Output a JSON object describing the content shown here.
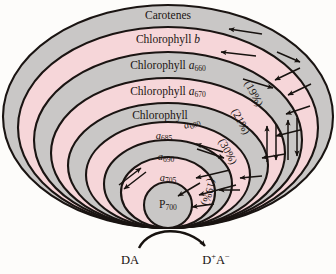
{
  "figure": {
    "background_color": "#fdfcfa",
    "outline_color": "#1a1412"
  },
  "colors": {
    "gray_band": "#c9c7c6",
    "pink_band": "#f6d6d9",
    "outline": "#1a1412",
    "text": "#17120f"
  },
  "bands": [
    {
      "index": 0,
      "label_main": "Carotenes",
      "label_sub": "",
      "italic_part": "",
      "fill": "#c9c7c6",
      "label_x": 168,
      "label_y": 16
    },
    {
      "index": 1,
      "label_main": "Chlorophyll ",
      "italic_part": "b",
      "label_sub": "",
      "fill": "#f6d6d9",
      "label_x": 168,
      "label_y": 40
    },
    {
      "index": 2,
      "label_main": "Chlorophyll ",
      "italic_part": "a",
      "label_sub": "660",
      "fill": "#c9c7c6",
      "label_x": 168,
      "label_y": 66
    },
    {
      "index": 3,
      "label_main": "Chlorophyll ",
      "italic_part": "a",
      "label_sub": "670",
      "fill": "#f6d6d9",
      "label_x": 168,
      "label_y": 92
    },
    {
      "index": 4,
      "label_main": "Chlorophyll",
      "italic_part": "",
      "label_sub": "",
      "fill": "#c9c7c6",
      "label_x": 160,
      "label_y": 116
    },
    {
      "index": 5,
      "label_main": "",
      "italic_part": "a",
      "label_sub": "685",
      "fill": "#f6d6d9",
      "label_x": 164,
      "label_y": 137
    },
    {
      "index": 6,
      "label_main": "",
      "italic_part": "a",
      "label_sub": "690",
      "fill": "#c9c7c6",
      "label_x": 166,
      "label_y": 158
    },
    {
      "index": 7,
      "label_main": "",
      "italic_part": "a",
      "label_sub": "705",
      "fill": "#f6d6d9",
      "label_x": 168,
      "label_y": 179
    },
    {
      "index": 8,
      "label_main": "P",
      "italic_part": "",
      "label_sub": "700",
      "fill": "#c9c7c6",
      "label_x": 168,
      "label_y": 205
    }
  ],
  "floating_labels": [
    {
      "name": "a680-label",
      "italic_part": "a",
      "label_sub": "680",
      "x": 192,
      "y": 124,
      "rotate": -22
    }
  ],
  "percentages": [
    {
      "name": "pct-19-upper",
      "text": "(19%)",
      "x": 253,
      "y": 94,
      "rotate": 62
    },
    {
      "name": "pct-21",
      "text": "(21%)",
      "x": 240,
      "y": 122,
      "rotate": 62
    },
    {
      "name": "pct-30",
      "text": "(30%)",
      "x": 227,
      "y": 152,
      "rotate": 62
    },
    {
      "name": "pct-19-lower",
      "text": "(19%)",
      "x": 208,
      "y": 192,
      "rotate": 105
    }
  ],
  "redox": {
    "donor_label": "DA",
    "product_label_main": "D",
    "product_sup_plus": "+",
    "product_label_a": "A",
    "product_sup_minus": "−",
    "donor_x": 130,
    "donor_y": 261,
    "product_x": 216,
    "product_y": 261
  },
  "arrows": {
    "count": 24,
    "description": "energy transfer arrows pointing inward and along the pigment bands toward the reaction center"
  }
}
